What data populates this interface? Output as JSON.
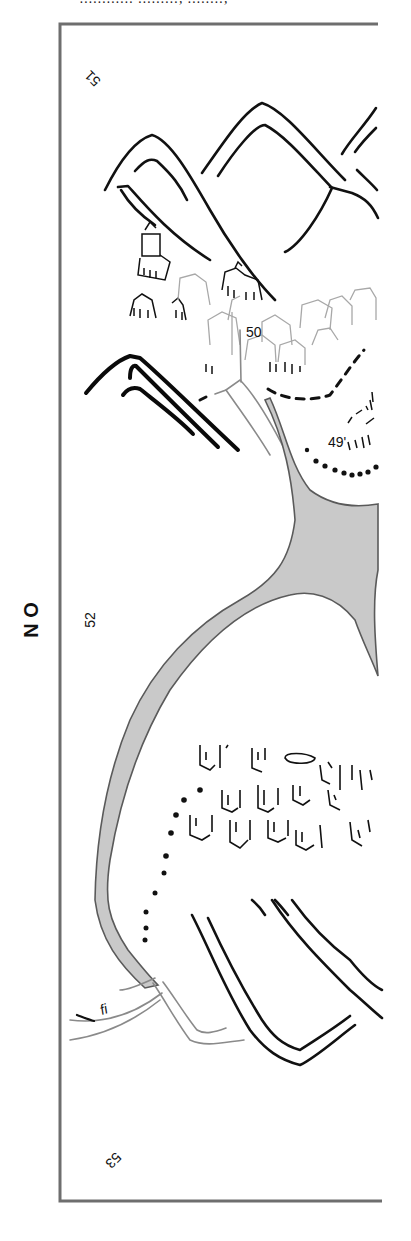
{
  "map": {
    "title_clipped": "............ ........., ........,",
    "direction_label": "N O",
    "grid_labels": {
      "top_left": "51",
      "center_left": "52",
      "bottom_left": "53"
    },
    "place_labels": {
      "city": "50",
      "settlement": "49'"
    },
    "stream_label": "fi",
    "colors": {
      "frame": "#6e6e6e",
      "ink": "#111111",
      "river_fill": "#c9c9c9",
      "river_edge": "#5a5a5a",
      "faint_ink": "#a8a8a8"
    },
    "features": [
      {
        "type": "mountain-range",
        "location": "top"
      },
      {
        "type": "mountain-range",
        "location": "left-middle"
      },
      {
        "type": "mountain-range",
        "location": "bottom-right"
      },
      {
        "type": "town",
        "label_ref": "city",
        "location": "upper"
      },
      {
        "type": "encampment",
        "label_ref": "settlement",
        "location": "upper-right"
      },
      {
        "type": "tent-camp",
        "location": "lower-center"
      },
      {
        "type": "river",
        "shape": "forked",
        "location": "center"
      },
      {
        "type": "dotted-boundary",
        "location": "lower-left"
      },
      {
        "type": "dashed-boundary",
        "location": "upper-right"
      }
    ]
  }
}
